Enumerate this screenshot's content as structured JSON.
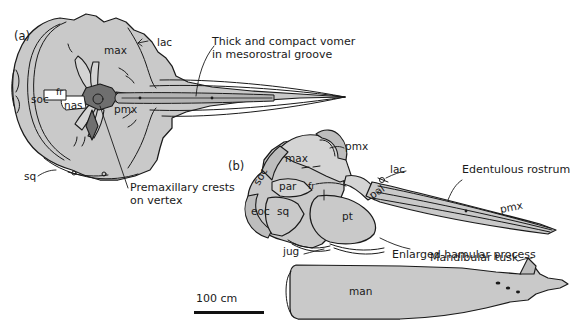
{
  "figure": {
    "type": "scientific-anatomical-illustration",
    "background_color": "#ffffff",
    "line_color": "#1a1a1a",
    "bone_fill_color": "#c9c9c9",
    "bone_fill_light": "#d8d8d8",
    "vertex_dark_fill": "#6f6f6f",
    "vomer_fill": "#b5b5b5",
    "text_color": "#1a1a1a"
  },
  "panels": [
    {
      "id": "a",
      "label": "(a)",
      "view": "dorsal view of cranium",
      "bone_labels": [
        {
          "key": "max",
          "text": "max"
        },
        {
          "key": "lac",
          "text": "lac"
        },
        {
          "key": "soc",
          "text": "soc"
        },
        {
          "key": "fr",
          "text": "fr"
        },
        {
          "key": "nas",
          "text": "nas"
        },
        {
          "key": "pmx",
          "text": "pmx"
        },
        {
          "key": "sq",
          "text": "sq"
        }
      ],
      "annotations": [
        {
          "key": "vomer",
          "line1": "Thick and compact vomer",
          "line2": "in mesorostral groove"
        },
        {
          "key": "crests",
          "line1": "Premaxillary crests",
          "line2": "on vertex"
        }
      ]
    },
    {
      "id": "b",
      "label": "(b)",
      "view": "lateral view of cranium and mandible",
      "bone_labels": [
        {
          "key": "pmx",
          "text": "pmx"
        },
        {
          "key": "max",
          "text": "max"
        },
        {
          "key": "soc",
          "text": "soc"
        },
        {
          "key": "par",
          "text": "par"
        },
        {
          "key": "fr",
          "text": "fr"
        },
        {
          "key": "eoc",
          "text": "eoc"
        },
        {
          "key": "sq",
          "text": "sq"
        },
        {
          "key": "jug",
          "text": "jug"
        },
        {
          "key": "pt",
          "text": "pt"
        },
        {
          "key": "lac",
          "text": "lac"
        },
        {
          "key": "pal",
          "text": "pal"
        },
        {
          "key": "pmx_rostrum",
          "text": "pmx"
        },
        {
          "key": "man",
          "text": "man"
        }
      ],
      "annotations": [
        {
          "key": "rostrum",
          "text": "Edentulous rostrum"
        },
        {
          "key": "hamular",
          "text": "Enlarged hamular process"
        },
        {
          "key": "tusk",
          "text": "Mandibular tusk"
        }
      ]
    }
  ],
  "scale_bar": {
    "label": "100 cm",
    "length_px": 70
  }
}
